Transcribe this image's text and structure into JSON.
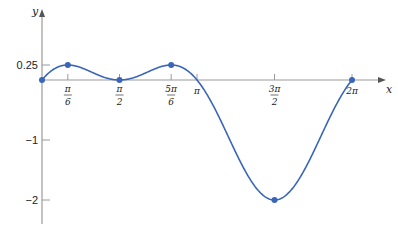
{
  "chart_data": {
    "type": "line",
    "title": "",
    "function": "y = sin x - sin^2 x",
    "xlabel": "x",
    "ylabel": "y",
    "xlim": [
      0,
      6.55
    ],
    "ylim": [
      -2.35,
      0.95
    ],
    "grid": false,
    "legend": null,
    "x_ticks": [
      {
        "value": 0.5236,
        "num": "π",
        "den": "6"
      },
      {
        "value": 1.5708,
        "num": "π",
        "den": "2"
      },
      {
        "value": 2.618,
        "num": "5π",
        "den": "6"
      },
      {
        "value": 3.1416,
        "label": "π"
      },
      {
        "value": 4.7124,
        "num": "3π",
        "den": "2"
      },
      {
        "value": 6.2832,
        "label": "2π"
      }
    ],
    "y_ticks": [
      {
        "value": 0.25,
        "label": "0.25"
      },
      {
        "value": -1,
        "label": "−1"
      },
      {
        "value": -2,
        "label": "−2"
      }
    ],
    "series": [
      {
        "name": "f(x)",
        "color": "#3a66b8",
        "marked_points": [
          {
            "x": 0,
            "y": 0
          },
          {
            "x": 0.5236,
            "y": 0.25
          },
          {
            "x": 1.5708,
            "y": 0
          },
          {
            "x": 2.618,
            "y": 0.25
          },
          {
            "x": 4.7124,
            "y": -2
          },
          {
            "x": 6.2832,
            "y": 0
          }
        ]
      }
    ]
  },
  "layout": {
    "origin_px": [
      42,
      80
    ],
    "px_per_x": 49.34,
    "px_per_y": 60,
    "axis_color": "#9a9a9a",
    "curve_color": "#3a66b8"
  }
}
